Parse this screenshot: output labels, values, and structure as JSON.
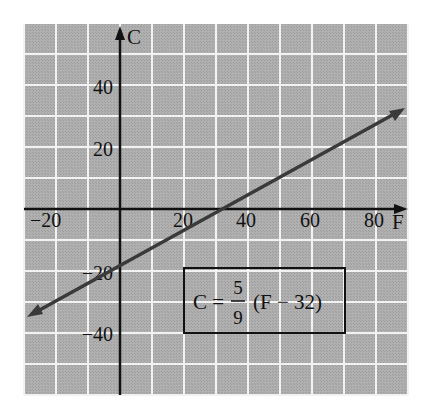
{
  "chart_data": {
    "type": "line",
    "title": "",
    "xlabel": "F",
    "ylabel": "C",
    "xlim": [
      -30,
      90
    ],
    "ylim": [
      -60,
      60
    ],
    "grid": true,
    "grid_step": 10,
    "x_ticks": [
      -20,
      20,
      40,
      60,
      80
    ],
    "x_tick_labels": [
      "−20",
      "20",
      "40",
      "60",
      "80"
    ],
    "y_ticks": [
      40,
      20,
      -20,
      -40
    ],
    "y_tick_labels": [
      "40",
      "20",
      "−20",
      "−40"
    ],
    "series": [
      {
        "name": "C = 5/9 (F − 32)",
        "equation": "C = 5/9 (F - 32)",
        "x": [
          -30,
          0,
          32,
          50,
          90
        ],
        "y": [
          -34.4,
          -17.8,
          0,
          10,
          32.2
        ],
        "arrows": "both"
      }
    ],
    "annotation": {
      "lhs": "C =",
      "numerator": "5",
      "denominator": "9",
      "rhs": "(F − 32)"
    }
  },
  "colors": {
    "grid_background": "#a9a9a9",
    "grid_lines": "#f2f2f2",
    "axes": "#111111",
    "line": "#3a3a3a"
  }
}
